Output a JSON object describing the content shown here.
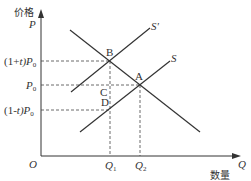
{
  "diagram": {
    "type": "supply-demand-tax",
    "axes": {
      "y_label_cn": "价格",
      "y_label": "P",
      "x_label_cn": "数量",
      "x_label": "Q",
      "origin": "O"
    },
    "price_levels": {
      "high": {
        "prefix": "(1+",
        "var": "t",
        "suffix": ")P",
        "sub": "0"
      },
      "base": {
        "main": "P",
        "sub": "0"
      },
      "low": {
        "prefix": "(1-",
        "var": "t",
        "suffix": ")P",
        "sub": "0"
      }
    },
    "quantity_levels": {
      "q1": {
        "main": "Q",
        "sub": "1"
      },
      "q2": {
        "main": "Q",
        "sub": "2"
      }
    },
    "curves": {
      "supply_shifted": "S'",
      "supply": "S"
    },
    "points": {
      "b": "B",
      "a": "A",
      "c": "C",
      "d": "D"
    }
  }
}
